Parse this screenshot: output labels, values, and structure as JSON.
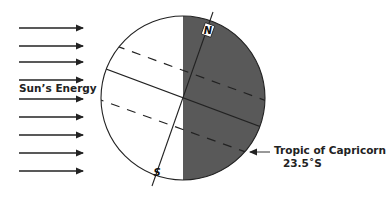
{
  "diagram": {
    "sun_label": "Sun’s Energy",
    "tropic_label": "Tropic of Capricorn",
    "tropic_value": "23.5˚S",
    "north_label": "N",
    "south_label": "S",
    "arrow_count": 9,
    "colors": {
      "night_side": "#595959",
      "day_side": "#ffffff",
      "lines": "#222222"
    }
  }
}
